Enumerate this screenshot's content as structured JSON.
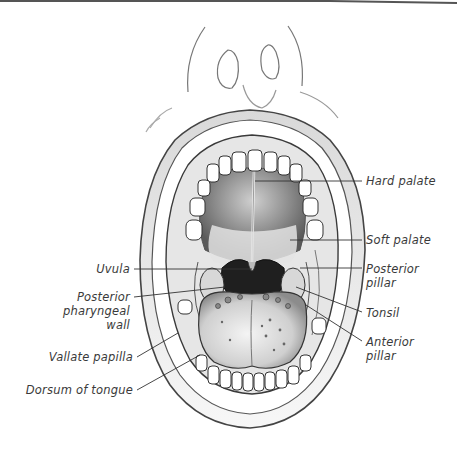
{
  "figure": {
    "colors": {
      "ink": "#3a3a3a",
      "shade": "#9a9a9a",
      "dark": "#222222",
      "paper": "#ffffff"
    }
  },
  "labels": {
    "right": [
      {
        "id": "hard-palate",
        "text": "Hard palate"
      },
      {
        "id": "soft-palate",
        "text": "Soft palate"
      },
      {
        "id": "posterior-pillar",
        "line1": "Posterior",
        "line2": "pillar"
      },
      {
        "id": "tonsil",
        "text": "Tonsil"
      },
      {
        "id": "anterior-pillar",
        "line1": "Anterior",
        "line2": "pillar"
      }
    ],
    "left": [
      {
        "id": "uvula",
        "text": "Uvula"
      },
      {
        "id": "posterior-pharyngeal-wall",
        "line1": "Posterior",
        "line2": "pharyngeal",
        "line3": "wall"
      },
      {
        "id": "vallate-papilla",
        "text": "Vallate papilla"
      },
      {
        "id": "dorsum-of-tongue",
        "text": "Dorsum of tongue"
      }
    ]
  }
}
